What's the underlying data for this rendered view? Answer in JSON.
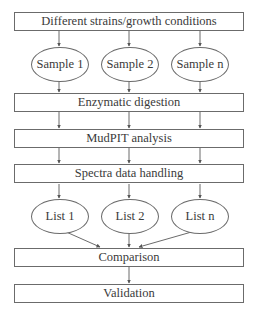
{
  "diagram": {
    "type": "flowchart",
    "direction": "top-to-bottom",
    "colors": {
      "stroke": "#6b6b6b",
      "text": "#3a3a3a",
      "background": "#ffffff"
    },
    "steps": {
      "conditions": "Different strains/growth conditions",
      "digestion": "Enzymatic digestion",
      "mudpit": "MudPIT analysis",
      "spectra": "Spectra data handling",
      "comparison": "Comparison",
      "validation": "Validation"
    },
    "samples": [
      "Sample 1",
      "Sample 2",
      "Sample n"
    ],
    "lists": [
      "List 1",
      "List 2",
      "List n"
    ],
    "edges": [
      {
        "from": "conditions",
        "to": "Sample 1"
      },
      {
        "from": "conditions",
        "to": "Sample 2"
      },
      {
        "from": "conditions",
        "to": "Sample n"
      },
      {
        "from": "Sample 1",
        "to": "digestion"
      },
      {
        "from": "Sample 2",
        "to": "digestion"
      },
      {
        "from": "Sample n",
        "to": "digestion"
      },
      {
        "from": "digestion",
        "to": "mudpit",
        "count": 3
      },
      {
        "from": "mudpit",
        "to": "spectra",
        "count": 3
      },
      {
        "from": "spectra",
        "to": "List 1"
      },
      {
        "from": "spectra",
        "to": "List 2"
      },
      {
        "from": "spectra",
        "to": "List n"
      },
      {
        "from": "List 1",
        "to": "comparison"
      },
      {
        "from": "List 2",
        "to": "comparison"
      },
      {
        "from": "List n",
        "to": "comparison"
      },
      {
        "from": "comparison",
        "to": "validation"
      }
    ]
  }
}
